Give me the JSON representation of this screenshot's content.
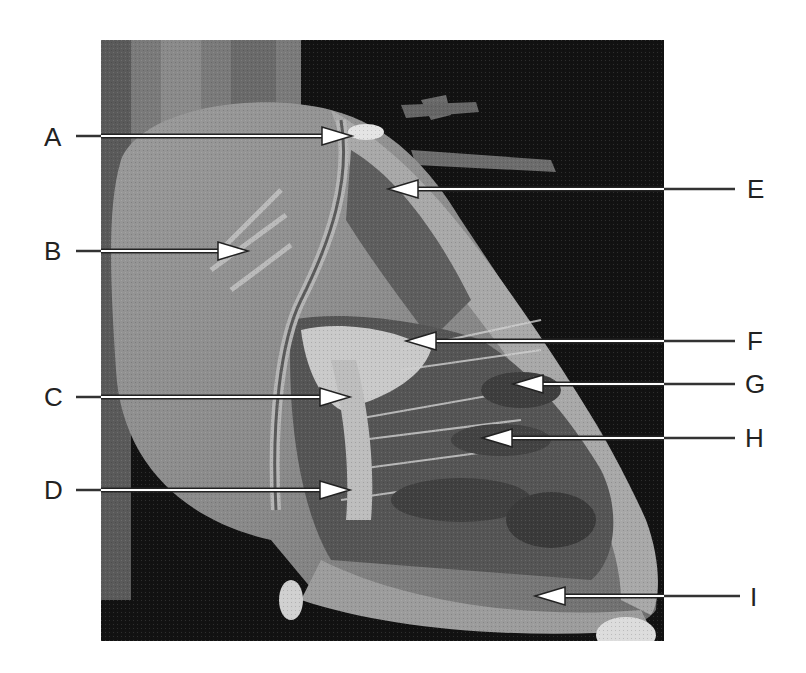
{
  "figure": {
    "background_color": "#111111"
  },
  "labels": [
    {
      "id": "A",
      "text": "A",
      "side": "left",
      "label_x": 44,
      "label_y": 124,
      "line_start": 76,
      "arrow_tip": 352,
      "y": 136
    },
    {
      "id": "B",
      "text": "B",
      "side": "left",
      "label_x": 44,
      "label_y": 238,
      "line_start": 76,
      "arrow_tip": 248,
      "y": 251
    },
    {
      "id": "C",
      "text": "C",
      "side": "left",
      "label_x": 44,
      "label_y": 384,
      "line_start": 76,
      "arrow_tip": 350,
      "y": 397
    },
    {
      "id": "D",
      "text": "D",
      "side": "left",
      "label_x": 44,
      "label_y": 477,
      "line_start": 76,
      "arrow_tip": 350,
      "y": 490
    },
    {
      "id": "E",
      "text": "E",
      "side": "right",
      "label_x": 747,
      "label_y": 176,
      "line_start": 735,
      "arrow_tip": 388,
      "y": 189
    },
    {
      "id": "F",
      "text": "F",
      "side": "right",
      "label_x": 747,
      "label_y": 328,
      "line_start": 735,
      "arrow_tip": 406,
      "y": 341
    },
    {
      "id": "G",
      "text": "G",
      "side": "right",
      "label_x": 745,
      "label_y": 371,
      "line_start": 735,
      "arrow_tip": 513,
      "y": 384
    },
    {
      "id": "H",
      "text": "H",
      "side": "right",
      "label_x": 745,
      "label_y": 425,
      "line_start": 735,
      "arrow_tip": 482,
      "y": 438
    },
    {
      "id": "I",
      "text": "I",
      "side": "right",
      "label_x": 750,
      "label_y": 584,
      "line_start": 740,
      "arrow_tip": 535,
      "y": 596
    }
  ]
}
